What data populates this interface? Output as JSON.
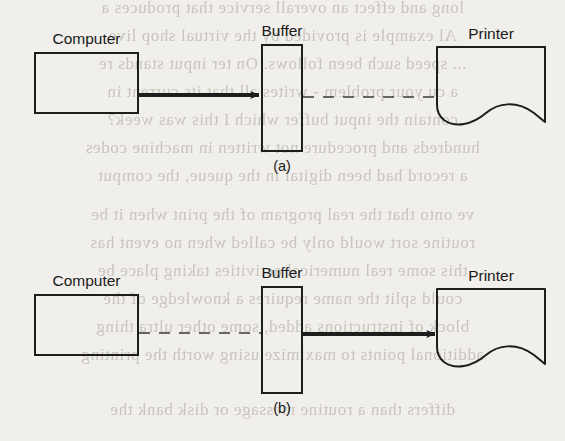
{
  "page": {
    "background_color": "#f1efeb",
    "ink_color": "#1d1d1d",
    "width": 565,
    "height": 441
  },
  "figure": {
    "caption_a": "(a)",
    "caption_b": "(b)",
    "panels": [
      {
        "id": "a",
        "caption": "(a)",
        "nodes": [
          {
            "id": "computer",
            "label": "Computer",
            "shape": "rectangle"
          },
          {
            "id": "buffer",
            "label": "Buffer",
            "shape": "rectangle"
          },
          {
            "id": "printer",
            "label": "Printer",
            "shape": "printer-paper"
          }
        ],
        "connections": [
          {
            "from": "computer",
            "to": "buffer",
            "style": "solid-arrow",
            "active": true
          },
          {
            "from": "buffer",
            "to": "printer",
            "style": "dashed",
            "active": false
          }
        ]
      },
      {
        "id": "b",
        "caption": "(b)",
        "nodes": [
          {
            "id": "computer",
            "label": "Computer",
            "shape": "rectangle"
          },
          {
            "id": "buffer",
            "label": "Buffer",
            "shape": "rectangle"
          },
          {
            "id": "printer",
            "label": "Printer",
            "shape": "printer-paper"
          }
        ],
        "connections": [
          {
            "from": "computer",
            "to": "buffer",
            "style": "dashed",
            "active": false
          },
          {
            "from": "buffer",
            "to": "printer",
            "style": "solid-arrow",
            "active": true
          }
        ]
      }
    ]
  },
  "bleed_text": {
    "lines": [
      "long and effect an overall service that produces a",
      "Al example is provided by the virtual shop live",
      "... speed such been follows. On ter input stands re",
      "a cu your problem - writes all that its current in",
      "contain the input buffer which I this was week?",
      "hundreds and procedure not written in machine codes",
      "a record had been digital in the queue, the comput",
      "ve onto that the real program of the print when it be",
      "routine sort would only be called when no event has",
      "this some real numerical activities taking place be",
      "could split the name requires a knowledge of the",
      "block of instructions added, some other ultra thing",
      "additional points to maximize using worth the printing",
      "differs than a routine message or disk bank the"
    ]
  }
}
